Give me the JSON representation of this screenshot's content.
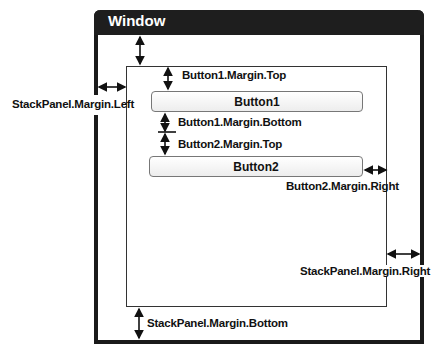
{
  "window": {
    "title": "Window"
  },
  "buttons": [
    {
      "label": "Button1"
    },
    {
      "label": "Button2"
    }
  ],
  "annotations": {
    "button1_margin_top": "Button1.Margin.Top",
    "button1_margin_bottom": "Button1.Margin.Bottom",
    "button2_margin_top": "Button2.Margin.Top",
    "button2_margin_right": "Button2.Margin.Right",
    "stackpanel_margin_left": "StackPanel.Margin.Left",
    "stackpanel_margin_right": "StackPanel.Margin.Right",
    "stackpanel_margin_bottom": "StackPanel.Margin.Bottom"
  },
  "colors": {
    "titlebar": "#1e1e1e",
    "border": "#1a1a1a",
    "button_border": "#777777"
  }
}
